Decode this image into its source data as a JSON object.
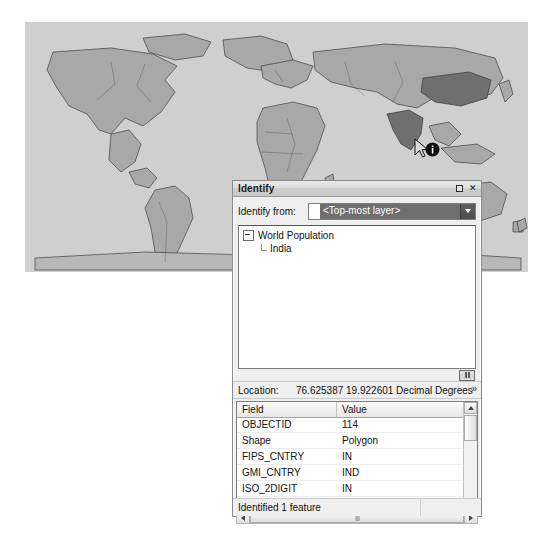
{
  "map": {
    "name": "world-population-map",
    "background_color": "#cfcfcf",
    "land_color": "#a8a8a8",
    "highlight_color": "#6f6f6f",
    "cursor": {
      "name": "identify-cursor",
      "glyph": "i",
      "x": 388,
      "y": 116
    }
  },
  "identify": {
    "titlebar": {
      "title": "Identify",
      "restore_label": "□",
      "close_label": "✕"
    },
    "identify_from": {
      "label": "Identify from:",
      "value": "<Top-most layer>",
      "options": [
        "<Top-most layer>",
        "<Visible layers>",
        "<Selectable layers>",
        "<All layers>",
        "World Population"
      ]
    },
    "tree": {
      "root": "World Population",
      "child": "India"
    },
    "location": {
      "label": "Location:",
      "value": "76.625387  19.922601 Decimal Degrees",
      "menu_glyph": "»"
    },
    "table": {
      "columns": [
        "Field",
        "Value"
      ],
      "rows": [
        {
          "field": "OBJECTID",
          "value": "114"
        },
        {
          "field": "Shape",
          "value": "Polygon"
        },
        {
          "field": "FIPS_CNTRY",
          "value": "IN"
        },
        {
          "field": "GMI_CNTRY",
          "value": "IND"
        },
        {
          "field": "ISO_2DIGIT",
          "value": "IN"
        },
        {
          "field": "ISO_3DIGIT",
          "value": "IND"
        },
        {
          "field": "ISO_NUM",
          "value": "356"
        },
        {
          "field": "CNTRY_NAME",
          "value": "India"
        }
      ]
    },
    "status": {
      "text": "Identified 1 feature"
    }
  }
}
